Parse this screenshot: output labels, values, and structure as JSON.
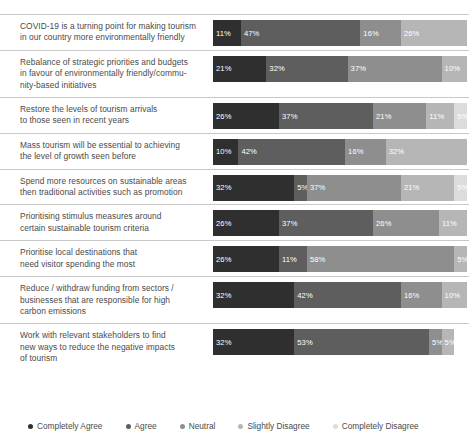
{
  "chart_data": {
    "type": "bar",
    "subtype": "stacked-horizontal-100-percent-likert",
    "title": "",
    "xlabel": "",
    "ylabel": "",
    "xlim": [
      0,
      100
    ],
    "grid": false,
    "legend_position": "bottom",
    "value_suffix": "%",
    "categories": [
      "COVID-19 is a turning point for making tourism in our country more environmentally friendly",
      "Rebalance of strategic priorities and budgets in favour of environmentally friendly/community-based initiatives",
      "Restore the levels of tourism arrivals to those seen in recent years",
      "Mass tourism will be essential to achieving the level of growth seen before",
      "Spend more resources on sustainable areas then traditional activities such as promotion",
      "Prioritising stimulus measures around certain sustainable tourism criteria",
      "Prioritise local destinations that need visitor spending the most",
      "Reduce / withdraw funding from sectors / businesses that are responsible for high carbon emissions",
      "Work with relevant stakeholders to find new ways to reduce the negative impacts of tourism"
    ],
    "series": [
      {
        "name": "Completely Agree",
        "color": "#2f2f2f",
        "values": [
          11,
          21,
          26,
          10,
          32,
          26,
          26,
          32,
          32
        ]
      },
      {
        "name": "Agree",
        "color": "#5e5e5e",
        "values": [
          47,
          32,
          37,
          42,
          5,
          37,
          11,
          42,
          53
        ]
      },
      {
        "name": "Neutral",
        "color": "#8e8e8e",
        "values": [
          16,
          37,
          21,
          16,
          37,
          26,
          58,
          16,
          5
        ]
      },
      {
        "name": "Slightly Disagree",
        "color": "#b6b6b6",
        "values": [
          26,
          10,
          11,
          32,
          21,
          11,
          5,
          10,
          5
        ]
      },
      {
        "name": "Completely Disagree",
        "color": "#dcdcdc",
        "values": [
          0,
          0,
          5,
          0,
          5,
          0,
          0,
          0,
          5
        ]
      }
    ]
  },
  "rows": [
    {
      "label": "COVID-19 is a turning point for making tourism in our country more environmentally friendly",
      "lines": [
        "COVID-19 is a turning point for making tourism",
        "in our country more environmentally friendly"
      ],
      "segments": [
        {
          "label": "11%",
          "value": 11
        },
        {
          "label": "47%",
          "value": 47
        },
        {
          "label": "16%",
          "value": 16
        },
        {
          "label": "26%",
          "value": 26
        },
        {
          "label": "",
          "value": 0
        }
      ]
    },
    {
      "label": "Rebalance of strategic priorities and budgets in favour of environmentally friendly/community-based initiatives",
      "lines": [
        "Rebalance of strategic priorities and budgets",
        "in favour of environmentally friendly/commu-",
        "nity-based initiatives"
      ],
      "segments": [
        {
          "label": "21%",
          "value": 21
        },
        {
          "label": "32%",
          "value": 32
        },
        {
          "label": "37%",
          "value": 37
        },
        {
          "label": "10%",
          "value": 10
        },
        {
          "label": "",
          "value": 0
        }
      ]
    },
    {
      "label": "Restore the levels of tourism arrivals to those seen in recent years",
      "lines": [
        "Restore the levels of tourism arrivals",
        "to those seen in recent years"
      ],
      "segments": [
        {
          "label": "26%",
          "value": 26
        },
        {
          "label": "37%",
          "value": 37
        },
        {
          "label": "21%",
          "value": 21
        },
        {
          "label": "11%",
          "value": 11
        },
        {
          "label": "5%",
          "value": 5
        }
      ]
    },
    {
      "label": "Mass tourism will be essential to achieving the level of growth seen before",
      "lines": [
        "Mass tourism will be essential to achieving",
        "the level of growth seen before"
      ],
      "segments": [
        {
          "label": "10%",
          "value": 10
        },
        {
          "label": "42%",
          "value": 42
        },
        {
          "label": "16%",
          "value": 16
        },
        {
          "label": "32%",
          "value": 32
        },
        {
          "label": "",
          "value": 0
        }
      ]
    },
    {
      "label": "Spend more resources on sustainable areas then traditional activities such as promotion",
      "lines": [
        "Spend more resources on sustainable areas",
        "then traditional activities such as promotion"
      ],
      "segments": [
        {
          "label": "32%",
          "value": 32
        },
        {
          "label": "5%",
          "value": 5
        },
        {
          "label": "37%",
          "value": 37
        },
        {
          "label": "21%",
          "value": 21
        },
        {
          "label": "5%",
          "value": 5
        }
      ]
    },
    {
      "label": "Prioritising stimulus measures around certain sustainable tourism criteria",
      "lines": [
        "Prioritising stimulus measures around",
        "certain sustainable tourism criteria"
      ],
      "segments": [
        {
          "label": "26%",
          "value": 26
        },
        {
          "label": "37%",
          "value": 37
        },
        {
          "label": "26%",
          "value": 26
        },
        {
          "label": "11%",
          "value": 11
        },
        {
          "label": "",
          "value": 0
        }
      ]
    },
    {
      "label": "Prioritise local destinations that need visitor spending the most",
      "lines": [
        "Prioritise local destinations that",
        "need visitor spending the most"
      ],
      "segments": [
        {
          "label": "26%",
          "value": 26
        },
        {
          "label": "11%",
          "value": 11
        },
        {
          "label": "58%",
          "value": 58
        },
        {
          "label": "5%",
          "value": 5
        },
        {
          "label": "",
          "value": 0
        }
      ]
    },
    {
      "label": "Reduce / withdraw funding from sectors / businesses that are responsible for high carbon emissions",
      "lines": [
        "Reduce / withdraw funding from sectors /",
        "businesses that are responsible for high",
        "carbon emissions"
      ],
      "segments": [
        {
          "label": "32%",
          "value": 32
        },
        {
          "label": "42%",
          "value": 42
        },
        {
          "label": "16%",
          "value": 16
        },
        {
          "label": "10%",
          "value": 10
        },
        {
          "label": "",
          "value": 0
        }
      ]
    },
    {
      "label": "Work with relevant stakeholders to find new ways to reduce the negative impacts of tourism",
      "lines": [
        "Work with relevant stakeholders to find",
        "new ways to reduce the negative impacts",
        "of tourism"
      ],
      "segments": [
        {
          "label": "32%",
          "value": 32
        },
        {
          "label": "53%",
          "value": 53
        },
        {
          "label": "5%",
          "value": 5
        },
        {
          "label": "5%",
          "value": 5
        },
        {
          "label": "",
          "value": 0
        }
      ]
    }
  ],
  "legend": {
    "items": [
      {
        "label": "Completely Agree",
        "color": "#2f2f2f"
      },
      {
        "label": "Agree",
        "color": "#5e5e5e"
      },
      {
        "label": "Neutral",
        "color": "#8e8e8e"
      },
      {
        "label": "Slightly Disagree",
        "color": "#b6b6b6"
      },
      {
        "label": "Completely Disagree",
        "color": "#dcdcdc"
      }
    ]
  }
}
